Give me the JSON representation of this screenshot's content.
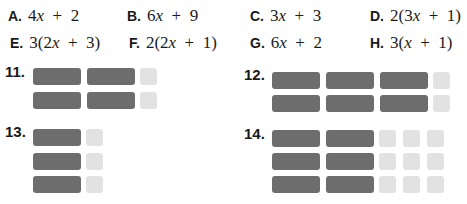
{
  "choices": [
    {
      "letter": "A.",
      "expr": "4x + 2"
    },
    {
      "letter": "B.",
      "expr": "6x + 9"
    },
    {
      "letter": "C.",
      "expr": "3x + 3"
    },
    {
      "letter": "D.",
      "expr": "2(3x + 1)"
    },
    {
      "letter": "E.",
      "expr": "3(2x + 3)"
    },
    {
      "letter": "F.",
      "expr": "2(2x + 1)"
    },
    {
      "letter": "G.",
      "expr": "6x + 2"
    },
    {
      "letter": "H.",
      "expr": "3(x + 1)"
    }
  ],
  "problems": [
    {
      "label": "11.",
      "rows": 2,
      "x_tiles_per_row": 2,
      "unit_tiles_per_row": 1
    },
    {
      "label": "12.",
      "rows": 2,
      "x_tiles_per_row": 3,
      "unit_tiles_per_row": 1
    },
    {
      "label": "13.",
      "rows": 3,
      "x_tiles_per_row": 1,
      "unit_tiles_per_row": 1
    },
    {
      "label": "14.",
      "rows": 3,
      "x_tiles_per_row": 2,
      "unit_tiles_per_row": 3
    }
  ],
  "colors": {
    "x_tile": "#6d6d6d",
    "unit_tile": "#e2e2e2"
  }
}
